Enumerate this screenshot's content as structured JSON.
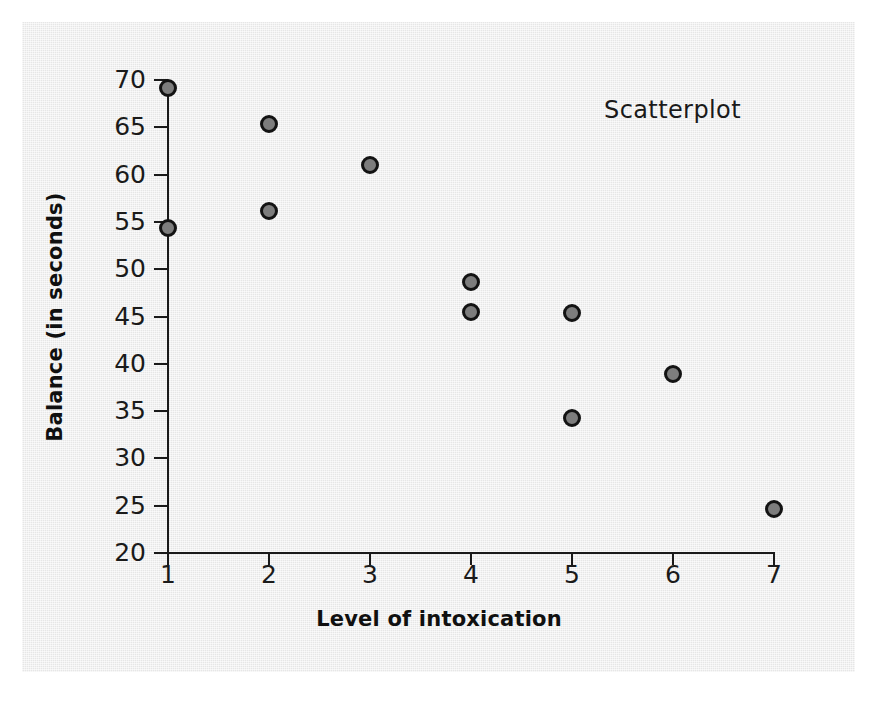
{
  "figure": {
    "panel_background": "#ebebeb",
    "page_background": "#ffffff",
    "annotation": "Scatterplot"
  },
  "axes": {
    "x_label": "Level of intoxication",
    "y_label": "Balance (in seconds)",
    "x_ticks": [
      "1",
      "2",
      "3",
      "4",
      "5",
      "6",
      "7"
    ],
    "y_ticks": [
      "70",
      "65",
      "60",
      "55",
      "50",
      "45",
      "40",
      "35",
      "30",
      "25",
      "20"
    ],
    "axis_color": "#1a1a1a"
  },
  "marker": {
    "fill": "#7d7d7d",
    "edge": "#131313"
  },
  "chart_data": {
    "type": "scatter",
    "title": "Scatterplot",
    "xlabel": "Level of intoxication",
    "ylabel": "Balance (in seconds)",
    "xlim": [
      1,
      7
    ],
    "ylim": [
      20,
      70
    ],
    "xticks": [
      1,
      2,
      3,
      4,
      5,
      6,
      7
    ],
    "yticks": [
      20,
      25,
      30,
      35,
      40,
      45,
      50,
      55,
      60,
      65,
      70
    ],
    "grid": false,
    "legend": null,
    "annotations": [
      {
        "text": "Scatterplot",
        "x": 5.3,
        "y": 66.5
      }
    ],
    "series": [
      {
        "name": "observations",
        "marker": "circle",
        "color": "#7d7d7d",
        "edge_color": "#131313",
        "points": [
          {
            "x": 1,
            "y": 69.2
          },
          {
            "x": 1,
            "y": 54.4
          },
          {
            "x": 2,
            "y": 65.3
          },
          {
            "x": 2,
            "y": 56.1
          },
          {
            "x": 3,
            "y": 61.0
          },
          {
            "x": 4,
            "y": 48.6
          },
          {
            "x": 4,
            "y": 45.5
          },
          {
            "x": 5,
            "y": 45.4
          },
          {
            "x": 5,
            "y": 34.3
          },
          {
            "x": 6,
            "y": 38.9
          },
          {
            "x": 7,
            "y": 24.6
          }
        ]
      }
    ]
  }
}
